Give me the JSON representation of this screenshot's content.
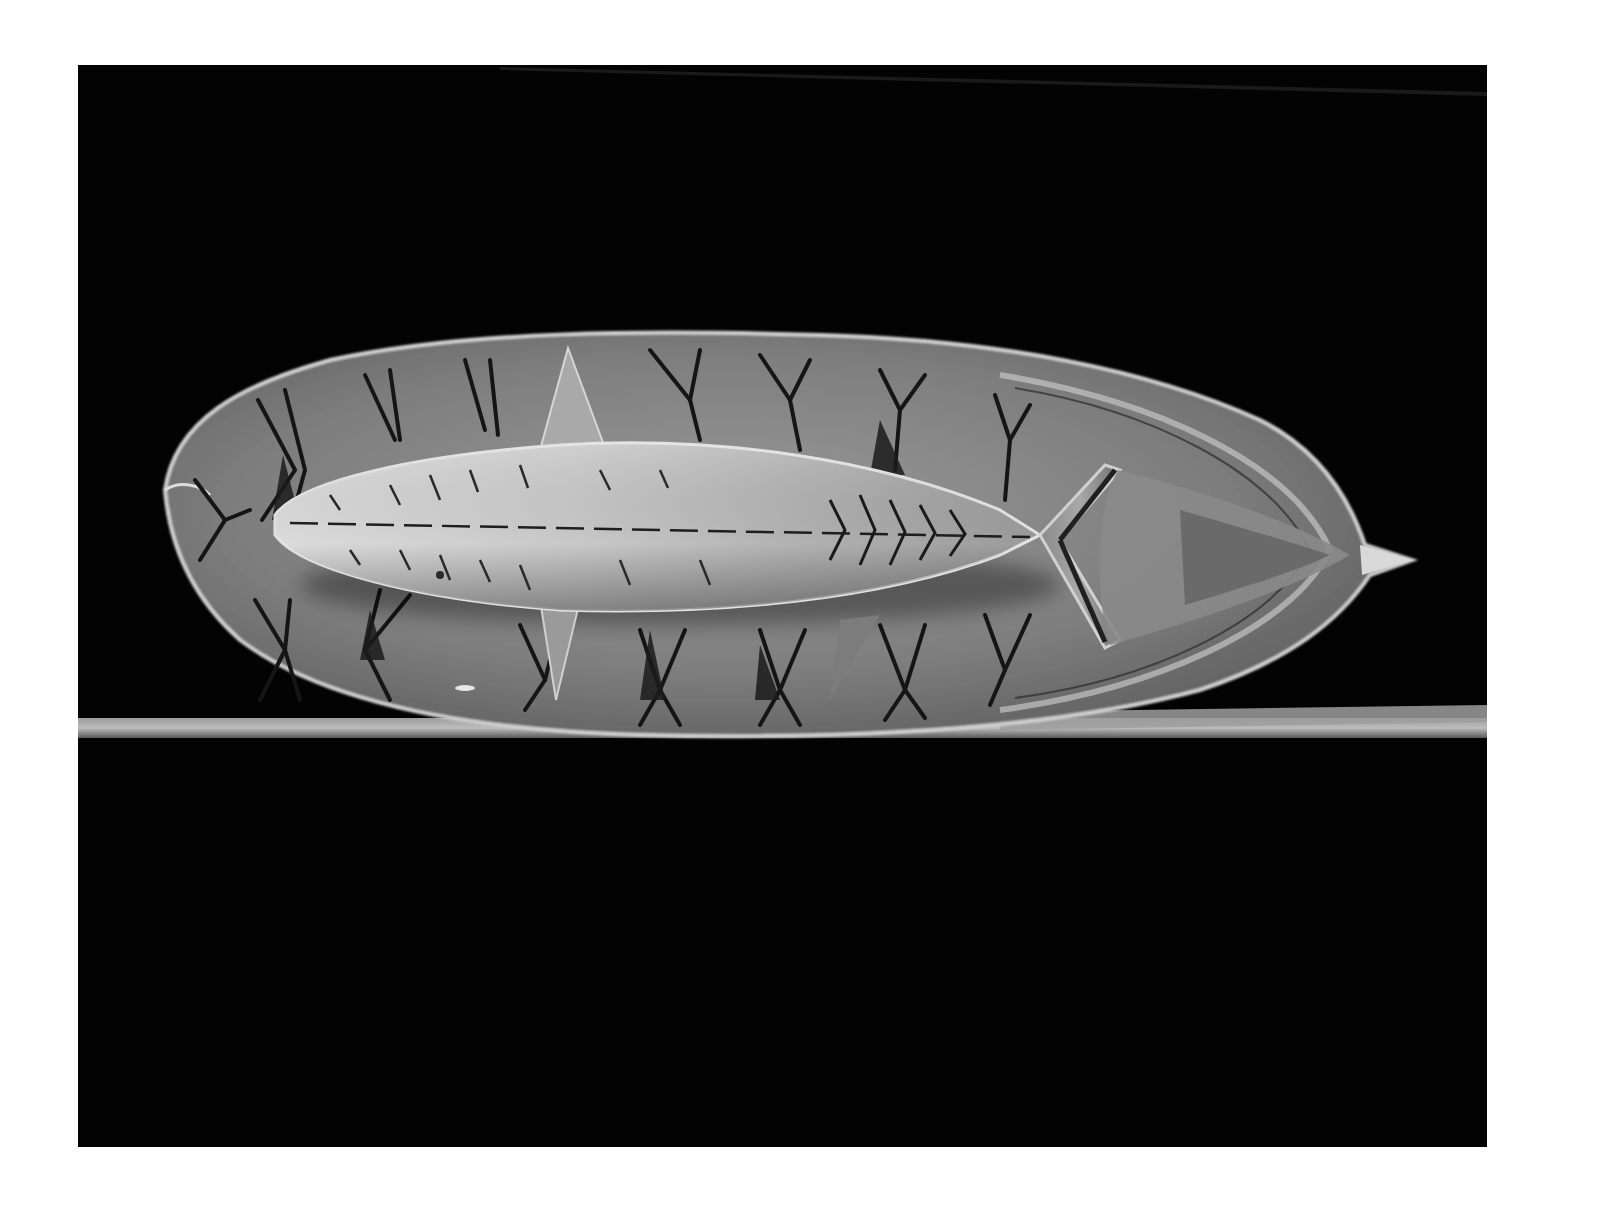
{
  "image": {
    "kind": "black-and-white photograph",
    "subject": "carved stone plate with relief fish and incised X motifs",
    "caption": ""
  },
  "canvas": {
    "width": 1613,
    "height": 1219,
    "border_color": "#ffffff"
  },
  "photo_area": {
    "x": 78,
    "y": 65,
    "width": 1409,
    "height": 1082,
    "background": "#030303"
  },
  "colors": {
    "plate_light": "#b9b9b9",
    "plate_mid": "#8e8e8e",
    "plate_dark": "#4a4a4a",
    "fish_light": "#d4d4d4",
    "incision": "#141414",
    "rod": "#8a8a8a",
    "rod_highlight": "#bdbdbd"
  },
  "objects": [
    {
      "name": "carved-plate",
      "shape": "leaf / boat-shaped oval",
      "bbox": [
        160,
        330,
        1415,
        740
      ]
    },
    {
      "name": "fish-relief",
      "shape": "elongated fish body",
      "bbox": [
        272,
        440,
        1040,
        610
      ]
    },
    {
      "name": "fish-tail",
      "shape": "forked tail lines",
      "bbox": [
        1030,
        460,
        1110,
        645
      ]
    },
    {
      "name": "support-rod",
      "shape": "horizontal bar",
      "bbox": [
        78,
        705,
        1487,
        742
      ]
    }
  ]
}
